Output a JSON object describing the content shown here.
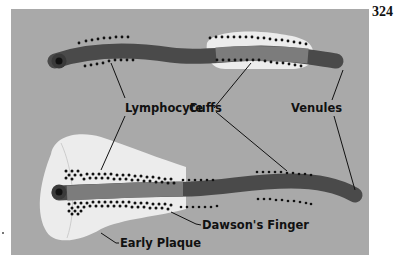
{
  "page_number": "324",
  "colors": {
    "background": "#a9a9a9",
    "venule": "#4a4a4a",
    "venule_lumen": "#1a1a1a",
    "plaque": "#ececec",
    "dawsons_finger": "#7c7c7c",
    "cuff_dots": "#111111",
    "leader_lines": "#111111"
  },
  "diagram": {
    "labels": {
      "lymphocyte_cuffs_1": "Lymphocyte",
      "lymphocyte_cuffs_2": "Cuffs",
      "venules": "Venules",
      "dawsons_finger": "Dawson's Finger",
      "early_plaque": "Early Plaque"
    },
    "components": [
      "Venule (upper) with lymphocyte cuffs and small demyelinating region",
      "Venule (lower) with Dawson's finger inside early plaque"
    ]
  }
}
